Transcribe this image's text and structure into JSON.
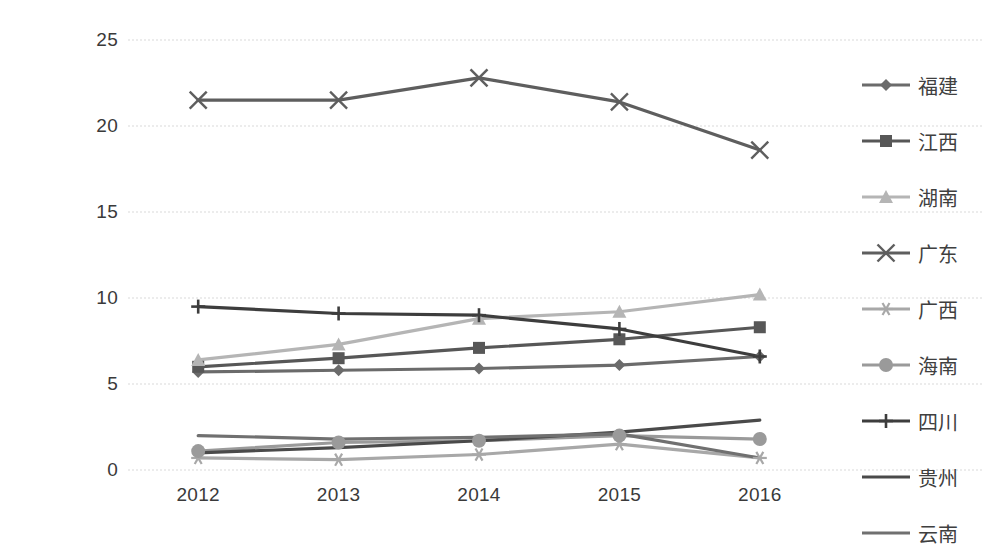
{
  "chart_data": {
    "type": "line",
    "title": "",
    "xlabel": "",
    "ylabel": "",
    "categories": [
      "2012",
      "2013",
      "2014",
      "2015",
      "2016"
    ],
    "x_tick_labels": [
      "2012",
      "2013",
      "2014",
      "2015",
      "2016"
    ],
    "y_tick_labels": [
      "0",
      "5",
      "10",
      "15",
      "20",
      "25"
    ],
    "y_ticks": [
      0,
      5,
      10,
      15,
      20,
      25
    ],
    "ylim": [
      0,
      25
    ],
    "grid": "horizontal-dotted",
    "legend_position": "right",
    "series": [
      {
        "name": "福建",
        "marker": "diamond",
        "color": "#6b6b6b",
        "values": [
          5.7,
          5.8,
          5.9,
          6.1,
          6.6
        ]
      },
      {
        "name": "江西",
        "marker": "square",
        "color": "#575757",
        "values": [
          6.0,
          6.5,
          7.1,
          7.6,
          8.3
        ]
      },
      {
        "name": "湖南",
        "marker": "triangle",
        "color": "#b5b5b5",
        "values": [
          6.4,
          7.3,
          8.8,
          9.2,
          10.2
        ]
      },
      {
        "name": "广东",
        "marker": "cross",
        "color": "#5e5e5e",
        "values": [
          21.5,
          21.5,
          22.8,
          21.4,
          18.6
        ]
      },
      {
        "name": "广西",
        "marker": "asterisk",
        "color": "#a8a8a8",
        "values": [
          0.7,
          0.6,
          0.9,
          1.5,
          0.7
        ]
      },
      {
        "name": "海南",
        "marker": "circle",
        "color": "#9a9a9a",
        "values": [
          1.1,
          1.6,
          1.7,
          2.0,
          1.8
        ]
      },
      {
        "name": "四川",
        "marker": "plus",
        "color": "#3d3d3d",
        "values": [
          9.5,
          9.1,
          9.0,
          8.2,
          6.6
        ]
      },
      {
        "name": "贵州",
        "marker": "none",
        "color": "#4a4a4a",
        "values": [
          1.0,
          1.3,
          1.7,
          2.2,
          2.9
        ]
      },
      {
        "name": "云南",
        "marker": "none",
        "color": "#707070",
        "values": [
          2.0,
          1.8,
          1.9,
          2.1,
          0.7
        ]
      }
    ]
  },
  "legend": {
    "items": [
      {
        "label": "福建"
      },
      {
        "label": "江西"
      },
      {
        "label": "湖南"
      },
      {
        "label": "广东"
      },
      {
        "label": "广西"
      },
      {
        "label": "海南"
      },
      {
        "label": "四川"
      },
      {
        "label": "贵州"
      },
      {
        "label": "云南"
      }
    ]
  },
  "colors": {
    "gridline": "#d9d9d9",
    "axis_text": "#3a3a3a",
    "background": "#ffffff"
  }
}
